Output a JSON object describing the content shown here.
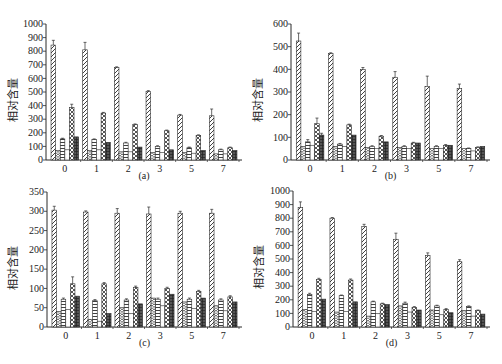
{
  "figure": {
    "colors": {
      "ink": "#2b2b2b",
      "dark_bar": "#4a4a4a",
      "background": "#ffffff"
    },
    "series_patterns": [
      "diagonal-hatch",
      "chevron",
      "horizontal-stripe",
      "blank-dotted",
      "crosshatch",
      "dark-grid"
    ]
  },
  "chart_data": [
    {
      "type": "bar",
      "panel": "(a)",
      "title": "",
      "caption": "(a)",
      "xlabel": "",
      "ylabel": "相对含量",
      "ylim": [
        0,
        1000
      ],
      "yticks": [
        0,
        100,
        200,
        300,
        400,
        500,
        600,
        700,
        800,
        900,
        1000
      ],
      "categories": [
        "0",
        "1",
        "2",
        "3",
        "5",
        "7"
      ],
      "grid": false,
      "legend": "none",
      "series": [
        {
          "name": "S1",
          "pattern": "diagonal-hatch",
          "values": [
            845,
            810,
            680,
            505,
            330,
            325
          ],
          "errors": [
            35,
            55,
            5,
            5,
            5,
            50
          ]
        },
        {
          "name": "S2",
          "pattern": "chevron",
          "values": [
            70,
            70,
            60,
            55,
            55,
            45
          ],
          "errors": [
            0,
            0,
            0,
            0,
            0,
            0
          ]
        },
        {
          "name": "S3",
          "pattern": "horizontal-stripe",
          "values": [
            155,
            150,
            125,
            100,
            90,
            75
          ],
          "errors": [
            5,
            5,
            5,
            5,
            5,
            5
          ]
        },
        {
          "name": "S4",
          "pattern": "blank-dotted",
          "values": [
            75,
            75,
            60,
            55,
            50,
            45
          ],
          "errors": [
            0,
            0,
            0,
            0,
            0,
            0
          ]
        },
        {
          "name": "S5",
          "pattern": "crosshatch",
          "values": [
            385,
            345,
            260,
            215,
            180,
            90
          ],
          "errors": [
            25,
            5,
            5,
            5,
            5,
            5
          ]
        },
        {
          "name": "S6",
          "pattern": "dark-grid",
          "values": [
            170,
            130,
            95,
            75,
            70,
            70
          ],
          "errors": [
            0,
            0,
            0,
            0,
            0,
            0
          ]
        }
      ]
    },
    {
      "type": "bar",
      "panel": "(b)",
      "title": "",
      "caption": "(b)",
      "xlabel": "",
      "ylabel": "相对含量",
      "ylim": [
        0,
        600
      ],
      "yticks": [
        0,
        100,
        200,
        300,
        400,
        500,
        600
      ],
      "categories": [
        "0",
        "1",
        "2",
        "3",
        "5",
        "7"
      ],
      "grid": false,
      "legend": "none",
      "series": [
        {
          "name": "S1",
          "pattern": "diagonal-hatch",
          "values": [
            525,
            470,
            400,
            365,
            325,
            315
          ],
          "errors": [
            35,
            3,
            8,
            25,
            45,
            20
          ]
        },
        {
          "name": "S2",
          "pattern": "chevron",
          "values": [
            60,
            60,
            55,
            55,
            50,
            50
          ],
          "errors": [
            0,
            0,
            0,
            0,
            0,
            0
          ]
        },
        {
          "name": "S3",
          "pattern": "horizontal-stripe",
          "values": [
            80,
            70,
            60,
            60,
            60,
            50
          ],
          "errors": [
            10,
            3,
            3,
            3,
            3,
            3
          ]
        },
        {
          "name": "S4",
          "pattern": "blank-dotted",
          "values": [
            65,
            60,
            50,
            50,
            50,
            40
          ],
          "errors": [
            0,
            0,
            0,
            0,
            0,
            0
          ]
        },
        {
          "name": "S5",
          "pattern": "crosshatch",
          "values": [
            160,
            155,
            105,
            75,
            65,
            55
          ],
          "errors": [
            25,
            3,
            3,
            3,
            3,
            3
          ]
        },
        {
          "name": "S6",
          "pattern": "dark-grid",
          "values": [
            110,
            110,
            80,
            75,
            65,
            60
          ],
          "errors": [
            8,
            0,
            0,
            0,
            0,
            0
          ]
        }
      ]
    },
    {
      "type": "bar",
      "panel": "(c)",
      "title": "",
      "caption": "(c)",
      "xlabel": "",
      "ylabel": "相对含量",
      "ylim": [
        0,
        350
      ],
      "yticks": [
        0,
        50,
        100,
        150,
        200,
        250,
        300,
        350
      ],
      "categories": [
        "0",
        "1",
        "2",
        "3",
        "5",
        "7"
      ],
      "grid": false,
      "legend": "none",
      "series": [
        {
          "name": "S1",
          "pattern": "diagonal-hatch",
          "values": [
            303,
            298,
            295,
            293,
            295,
            295
          ],
          "errors": [
            10,
            3,
            12,
            18,
            5,
            10
          ]
        },
        {
          "name": "S2",
          "pattern": "chevron",
          "values": [
            40,
            20,
            50,
            75,
            65,
            55
          ],
          "errors": [
            0,
            0,
            0,
            0,
            0,
            0
          ]
        },
        {
          "name": "S3",
          "pattern": "horizontal-stripe",
          "values": [
            72,
            68,
            70,
            72,
            72,
            70
          ],
          "errors": [
            3,
            3,
            3,
            3,
            3,
            3
          ]
        },
        {
          "name": "S4",
          "pattern": "blank-dotted",
          "values": [
            45,
            15,
            35,
            55,
            48,
            42
          ],
          "errors": [
            0,
            0,
            0,
            0,
            0,
            0
          ]
        },
        {
          "name": "S5",
          "pattern": "crosshatch",
          "values": [
            112,
            112,
            103,
            100,
            92,
            78
          ],
          "errors": [
            18,
            3,
            3,
            3,
            3,
            3
          ]
        },
        {
          "name": "S6",
          "pattern": "dark-grid",
          "values": [
            80,
            35,
            60,
            85,
            75,
            65
          ],
          "errors": [
            0,
            0,
            0,
            0,
            0,
            0
          ]
        }
      ]
    },
    {
      "type": "bar",
      "panel": "(d)",
      "title": "",
      "caption": "(d)",
      "xlabel": "",
      "ylabel": "相对含量",
      "ylim": [
        0,
        1000
      ],
      "yticks": [
        0,
        100,
        200,
        300,
        400,
        500,
        600,
        700,
        800,
        900,
        1000
      ],
      "categories": [
        "0",
        "1",
        "2",
        "3",
        "5",
        "7"
      ],
      "grid": false,
      "legend": "none",
      "series": [
        {
          "name": "S1",
          "pattern": "diagonal-hatch",
          "values": [
            880,
            800,
            740,
            645,
            525,
            480
          ],
          "errors": [
            40,
            5,
            15,
            45,
            20,
            15
          ]
        },
        {
          "name": "S2",
          "pattern": "chevron",
          "values": [
            130,
            110,
            80,
            155,
            125,
            120
          ],
          "errors": [
            0,
            0,
            0,
            0,
            0,
            0
          ]
        },
        {
          "name": "S3",
          "pattern": "horizontal-stripe",
          "values": [
            240,
            230,
            185,
            175,
            155,
            150
          ],
          "errors": [
            8,
            5,
            5,
            8,
            5,
            5
          ]
        },
        {
          "name": "S4",
          "pattern": "blank-dotted",
          "values": [
            115,
            115,
            100,
            110,
            90,
            80
          ],
          "errors": [
            0,
            0,
            0,
            0,
            0,
            0
          ]
        },
        {
          "name": "S5",
          "pattern": "crosshatch",
          "values": [
            350,
            345,
            170,
            145,
            130,
            120
          ],
          "errors": [
            8,
            8,
            5,
            5,
            5,
            5
          ]
        },
        {
          "name": "S6",
          "pattern": "dark-grid",
          "values": [
            205,
            185,
            165,
            125,
            105,
            95
          ],
          "errors": [
            0,
            0,
            0,
            0,
            0,
            0
          ]
        }
      ]
    }
  ]
}
